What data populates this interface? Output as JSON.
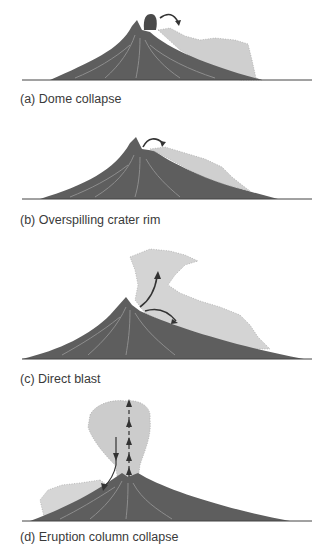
{
  "figure": {
    "colors": {
      "volcano": "#5e5e5e",
      "volcano_dark": "#4a4a4a",
      "streak": "#9a9a9a",
      "flow": "#c8c8c8",
      "flow_light": "#dcdcdc",
      "ground": "#444444",
      "arrow": "#333333",
      "caption": "#3a3a3a"
    },
    "panels": [
      {
        "id": "a",
        "caption": "(a) Dome collapse"
      },
      {
        "id": "b",
        "caption": "(b) Overspilling crater rim"
      },
      {
        "id": "c",
        "caption": "(c) Direct blast"
      },
      {
        "id": "d",
        "caption": "(d) Eruption column collapse"
      }
    ]
  }
}
